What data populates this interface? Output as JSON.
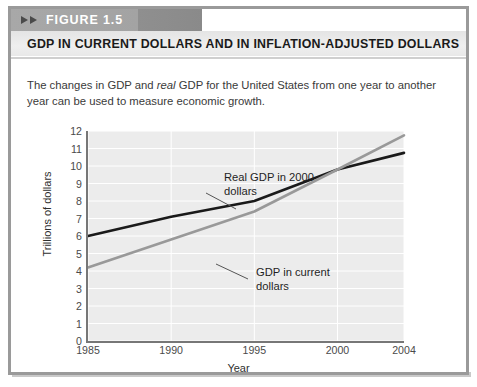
{
  "figure": {
    "badge_label": "FIGURE 1.5",
    "title": "GDP IN CURRENT DOLLARS AND IN INFLATION-ADJUSTED DOLLARS",
    "caption_before": "The changes in GDP and ",
    "caption_italic": "real",
    "caption_after": " GDP for the United States from one year to another year can be used to measure economic growth."
  },
  "chart_data": {
    "type": "line",
    "title": "GDP IN CURRENT DOLLARS AND IN INFLATION-ADJUSTED DOLLARS",
    "xlabel": "Year",
    "ylabel": "Trillions of dollars",
    "x": [
      1985,
      1990,
      1995,
      2000,
      2004
    ],
    "xtick_labels": [
      "1985",
      "1990",
      "1995",
      "2000",
      "2004"
    ],
    "xlim": [
      1985,
      2004
    ],
    "ylim": [
      0,
      12
    ],
    "yticks": [
      12,
      11,
      10,
      9,
      8,
      7,
      6,
      5,
      4,
      3,
      2,
      1,
      0
    ],
    "ytick_labels": [
      "12",
      "11",
      "10",
      "9",
      "8",
      "7",
      "6",
      "5",
      "4",
      "3",
      "2",
      "1",
      "0"
    ],
    "grid": true,
    "grid_color": "#ffffff",
    "plot_background": "#ececec",
    "legend": "annotations",
    "series": [
      {
        "name": "Real GDP in 2000 dollars",
        "annotation_line1": "Real GDP in 2000",
        "annotation_line2": "dollars",
        "color": "#1a1a1a",
        "values": [
          6.0,
          7.1,
          8.0,
          9.8,
          10.75
        ]
      },
      {
        "name": "GDP in current dollars",
        "annotation_line1": "GDP in current",
        "annotation_line2": "dollars",
        "color": "#999999",
        "values": [
          4.2,
          5.8,
          7.4,
          9.8,
          11.75
        ]
      }
    ]
  },
  "colors": {
    "band_gray": "#a3a3a3",
    "frame_gray": "#9a9a9a",
    "real_gdp": "#1a1a1a",
    "nominal_gdp": "#999999"
  }
}
